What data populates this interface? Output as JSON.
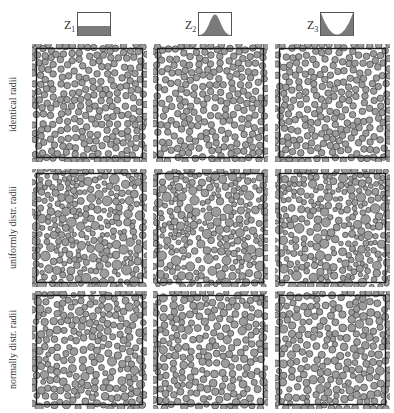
{
  "figure": {
    "columns": [
      {
        "label": "Z",
        "sub": "1",
        "distribution": "uniform",
        "icon": "uniform-distribution-icon"
      },
      {
        "label": "Z",
        "sub": "2",
        "distribution": "peaked (bell-shaped)",
        "icon": "bell-distribution-icon"
      },
      {
        "label": "Z",
        "sub": "3",
        "distribution": "bimodal (U-shaped)",
        "icon": "u-distribution-icon"
      }
    ],
    "rows": [
      {
        "label": "identical radii",
        "radius_mode": "identical"
      },
      {
        "label": "uniformly distr. radii",
        "radius_mode": "uniform"
      },
      {
        "label": "normally distr. radii",
        "radius_mode": "normal"
      }
    ],
    "colors": {
      "circle_fill": "#9c9c9c",
      "circle_stroke": "#2e2e2e",
      "frame": "#1a1a1a",
      "icon_fill": "#7a7a7a",
      "icon_border": "#555555"
    }
  }
}
